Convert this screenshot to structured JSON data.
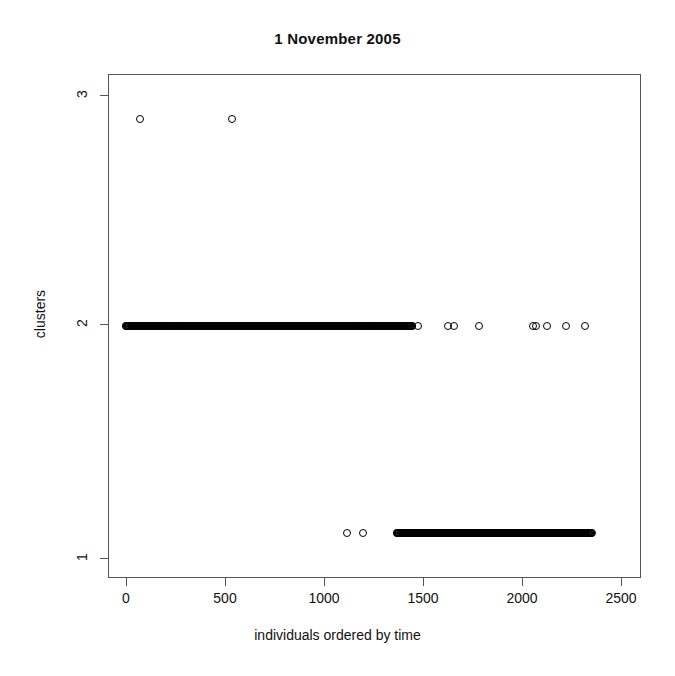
{
  "chart_data": {
    "type": "scatter",
    "title": "1 November 2005",
    "xlabel": "individuals ordered by time",
    "ylabel": "clusters",
    "xlim": [
      -90,
      2800
    ],
    "ylim": [
      0.78,
      3.22
    ],
    "grid": false,
    "legend": null,
    "marker": "open-circle",
    "xticks": [
      0,
      500,
      1000,
      1500,
      2000,
      2500
    ],
    "xticklabels": [
      "0",
      "500",
      "1000",
      "1500",
      "2000",
      "2500"
    ],
    "yticks": [
      1,
      2,
      3
    ],
    "yticklabels": [
      "1",
      "2",
      "3"
    ],
    "series": [
      {
        "name": "cluster 3",
        "y": 3,
        "x": [
          85,
          585
        ]
      },
      {
        "name": "cluster 2",
        "y": 2,
        "x_dense_ranges": [
          [
            5,
            1560
          ]
        ],
        "x_isolated": [
          1590,
          1752,
          1786,
          1920,
          2212,
          2232,
          2292,
          2396,
          2496
        ]
      },
      {
        "name": "cluster 1",
        "y": 1,
        "x_dense_ranges": [
          [
            1475,
            2535
          ]
        ],
        "x_isolated": [
          1208,
          1292
        ]
      }
    ],
    "point_counts": {
      "cluster_3": 2,
      "cluster_2": 1572,
      "cluster_1": 1062
    }
  },
  "figure": {
    "title": "1 November 2005",
    "xlabel": "individuals ordered by time",
    "ylabel": "clusters",
    "xticklabels": [
      "0",
      "500",
      "1000",
      "1500",
      "2000",
      "2500"
    ],
    "yticklabels": [
      "1",
      "2",
      "3"
    ]
  }
}
